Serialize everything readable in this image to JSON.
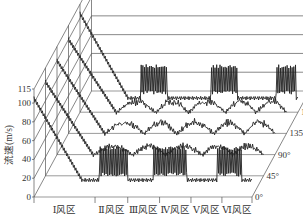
{
  "chart_data": {
    "type": "line",
    "subtype": "3d-waterfall",
    "title": "",
    "ylabel": "流速(m/s)",
    "ylim": [
      0,
      115
    ],
    "y_ticks": [
      "0",
      "20",
      "40",
      "60",
      "80",
      "100",
      "115"
    ],
    "x_categories": [
      "Ⅰ风区",
      "Ⅱ风区",
      "Ⅲ风区",
      "Ⅳ风区",
      "Ⅴ风区",
      "Ⅵ风区"
    ],
    "depth_labels": [
      "0°",
      "45°",
      "90°",
      "135°",
      "180°"
    ],
    "series": [
      {
        "name": "0°",
        "start": 105,
        "base": 18,
        "description": "drops from ~105 at inlet to ~18, strong oscillation bursts in Ⅱ, Ⅳ and Ⅵ zones reaching ~48"
      },
      {
        "name": "45°",
        "start": 100,
        "base": 22,
        "description": "drops to ~22, gentle wavy rises in each zone"
      },
      {
        "name": "90°",
        "start": 100,
        "base": 22,
        "description": "drops to ~22, saw-tooth rises per zone up to ~40"
      },
      {
        "name": "135°",
        "start": 100,
        "base": 22,
        "description": "drops to ~22, saw-tooth rises per zone up to ~35"
      },
      {
        "name": "180°",
        "start": 105,
        "base": 15,
        "description": "drops to ~15, oscillation bursts in Ⅲ, Ⅴ and Ⅵ zones reaching ~45"
      }
    ],
    "grid": true,
    "legend": "none"
  }
}
